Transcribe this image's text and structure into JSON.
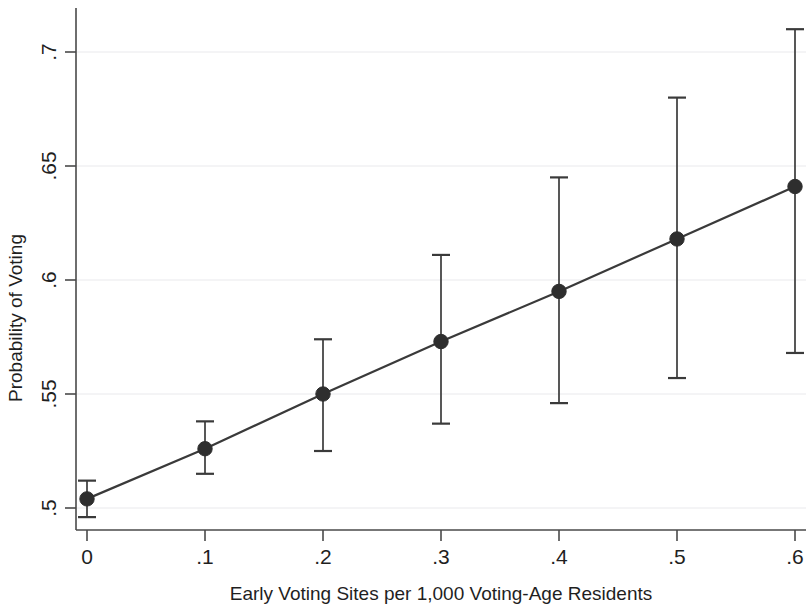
{
  "chart_data": {
    "type": "line",
    "title": "",
    "subtitle": "",
    "xlabel": "Early Voting Sites per 1,000 Voting-Age Residents",
    "ylabel": "Probability of Voting",
    "x": [
      0,
      0.1,
      0.2,
      0.3,
      0.4,
      0.5,
      0.6
    ],
    "values": [
      0.504,
      0.526,
      0.55,
      0.573,
      0.595,
      0.618,
      0.641
    ],
    "ci_lower": [
      0.496,
      0.515,
      0.525,
      0.537,
      0.546,
      0.557,
      0.568
    ],
    "ci_upper": [
      0.512,
      0.538,
      0.574,
      0.611,
      0.645,
      0.68,
      0.71
    ],
    "series": [
      {
        "name": "Predicted probability of voting",
        "values": [
          0.504,
          0.526,
          0.55,
          0.573,
          0.595,
          0.618,
          0.641
        ]
      }
    ],
    "xlim": [
      -0.022,
      0.622
    ],
    "ylim": [
      0.4855,
      0.7055
    ],
    "xticks": [
      0,
      0.1,
      0.2,
      0.3,
      0.4,
      0.5,
      0.6
    ],
    "xtick_labels": [
      "0",
      ".1",
      ".2",
      ".3",
      ".4",
      ".5",
      ".6"
    ],
    "yticks": [
      0.5,
      0.55,
      0.6,
      0.65,
      0.7
    ],
    "ytick_labels": [
      ".5",
      ".55",
      ".6",
      ".65",
      ".7"
    ],
    "grid": "horizontal",
    "legend": "none",
    "marker": "filled-circle",
    "error_bars": "vertical-capped",
    "colors": {
      "line": "#3a3a3a",
      "marker": "#2e2e2e",
      "error_bar": "#3a3a3a",
      "gridline": "#e9e9ec",
      "axis": "#4a4a4a",
      "background": "#ffffff",
      "text": "#1f1f1f"
    }
  },
  "axes": {
    "x_title": "Early Voting Sites per 1,000 Voting-Age Residents",
    "y_title": "Probability of Voting"
  }
}
